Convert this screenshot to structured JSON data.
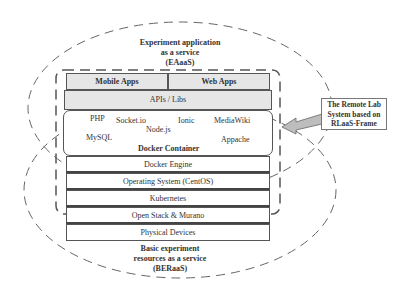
{
  "top_region": {
    "label_line1": "Experiment application",
    "label_line2": "as a service",
    "label_line3": "(EAaaS)"
  },
  "bottom_region": {
    "label_line1": "Basic experiment",
    "label_line2": "resources as a service",
    "label_line3": "(BERaaS)"
  },
  "apps": {
    "mobile": "Mobile Apps",
    "web": "Web Apps"
  },
  "apis": "APIs / Libs",
  "docker_container": {
    "title": "Docker Container",
    "items": [
      "PHP",
      "Socket.io",
      "Ionic",
      "MediaWiki",
      "Node.js",
      "MySQL",
      "Appache"
    ]
  },
  "layers": [
    "Docker Engine",
    "Operating System (CentOS)",
    "Kubernetes",
    "Open Stack & Murano",
    "Physical Devices"
  ],
  "callout": {
    "line1": "The Remote Lab",
    "line2": "System based on",
    "line3": "RLaaS-Frame"
  }
}
